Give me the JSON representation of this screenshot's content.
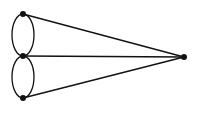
{
  "diagram": {
    "type": "multigraph",
    "colors": {
      "stroke": "#111111",
      "background": "#ffffff"
    },
    "vertices": [
      {
        "id": "top",
        "x": 23,
        "y": 14
      },
      {
        "id": "middle",
        "x": 23,
        "y": 56
      },
      {
        "id": "bottom",
        "x": 23,
        "y": 98
      },
      {
        "id": "right",
        "x": 184,
        "y": 57
      }
    ],
    "edges": [
      {
        "from": "top",
        "to": "right",
        "kind": "straight"
      },
      {
        "from": "middle",
        "to": "right",
        "kind": "straight"
      },
      {
        "from": "bottom",
        "to": "right",
        "kind": "straight"
      },
      {
        "from": "top",
        "to": "middle",
        "kind": "curved-left"
      },
      {
        "from": "top",
        "to": "middle",
        "kind": "curved-right"
      },
      {
        "from": "middle",
        "to": "bottom",
        "kind": "curved-left"
      },
      {
        "from": "middle",
        "to": "bottom",
        "kind": "curved-right"
      }
    ]
  }
}
